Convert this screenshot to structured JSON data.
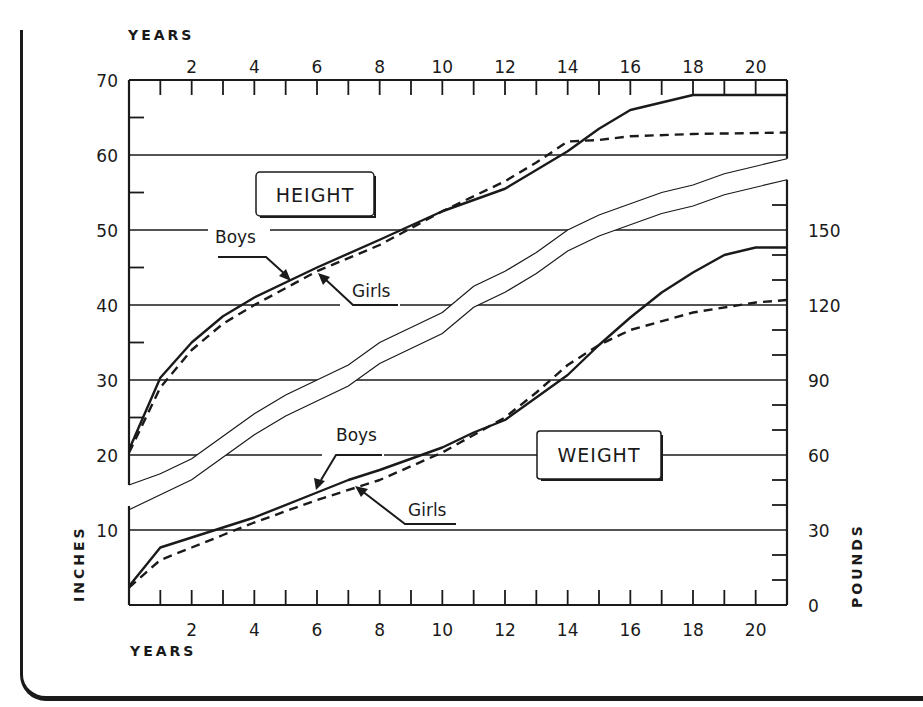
{
  "chart_data": {
    "type": "line",
    "title": "",
    "x_axis": {
      "label_top": "YEARS",
      "label_bottom": "YEARS",
      "range": [
        0,
        21
      ],
      "ticks": [
        2,
        4,
        6,
        8,
        10,
        12,
        14,
        16,
        18,
        20
      ],
      "minor_tick_step": 1
    },
    "y_axis_left": {
      "label": "INCHES",
      "range": [
        0,
        70
      ],
      "ticks": [
        10,
        20,
        30,
        40,
        50,
        60,
        70
      ],
      "minor_tick_step": 5
    },
    "y_axis_right": {
      "label": "POUNDS",
      "range": [
        0,
        175
      ],
      "ticks": [
        0,
        30,
        60,
        90,
        120,
        150
      ],
      "minor_tick_step": 10
    },
    "panels": [
      {
        "name": "HEIGHT",
        "axis": "left",
        "unit": "inches",
        "series": [
          {
            "name": "Boys",
            "style": "solid",
            "x": [
              0,
              1,
              2,
              3,
              4,
              6,
              8,
              10,
              12,
              13,
              14,
              15,
              16,
              18,
              21
            ],
            "values": [
              20.7,
              30.3,
              35,
              38.5,
              41,
              45,
              48.7,
              52.5,
              55.5,
              58,
              60.5,
              63.5,
              66,
              68,
              68
            ]
          },
          {
            "name": "Girls",
            "style": "dashed",
            "x": [
              0,
              1,
              2,
              3,
              4,
              6,
              8,
              10,
              12,
              13,
              14,
              15,
              16,
              18,
              21
            ],
            "values": [
              20.3,
              29,
              34,
              37.5,
              40,
              44.5,
              48,
              52.5,
              56.5,
              59,
              61.8,
              62,
              62.5,
              62.8,
              63
            ]
          }
        ]
      },
      {
        "name": "WEIGHT",
        "axis": "right",
        "unit": "pounds",
        "series": [
          {
            "name": "Boys",
            "style": "solid",
            "x": [
              0,
              1,
              2,
              3,
              4,
              6,
              7,
              8,
              10,
              11,
              12,
              13,
              14,
              15,
              16,
              17,
              18,
              19,
              20,
              21
            ],
            "values": [
              7.5,
              23,
              27,
              31,
              35,
              45,
              50,
              54,
              63,
              69,
              74,
              83,
              92,
              104,
              115,
              125,
              133,
              140,
              143,
              143
            ]
          },
          {
            "name": "Girls",
            "style": "dashed",
            "x": [
              0,
              1,
              2,
              3,
              4,
              6,
              8,
              10,
              11,
              12,
              13,
              14,
              15,
              16,
              18,
              20,
              21
            ],
            "values": [
              7,
              18,
              23,
              28,
              33,
              42,
              50,
              61,
              68,
              75,
              85,
              96,
              104,
              110,
              117,
              121,
              122
            ]
          }
        ]
      }
    ],
    "annotations": [
      "HEIGHT",
      "WEIGHT",
      "Boys",
      "Girls",
      "Boys",
      "Girls"
    ],
    "grid": true,
    "legend": "inline arrows"
  },
  "labels": {
    "years_top": "YEARS",
    "years_bottom": "YEARS",
    "inches": "INCHES",
    "pounds": "POUNDS",
    "height_box": "HEIGHT",
    "weight_box": "WEIGHT",
    "height_boys": "Boys",
    "height_girls": "Girls",
    "weight_boys": "Boys",
    "weight_girls": "Girls"
  },
  "ticks": {
    "x_top": [
      "2",
      "4",
      "6",
      "8",
      "10",
      "12",
      "14",
      "16",
      "18",
      "20"
    ],
    "x_bottom": [
      "2",
      "4",
      "6",
      "8",
      "10",
      "12",
      "14",
      "16",
      "18",
      "20"
    ],
    "left": [
      "70",
      "60",
      "50",
      "40",
      "30",
      "20",
      "10"
    ],
    "right": [
      "150",
      "120",
      "90",
      "60",
      "30",
      "0"
    ]
  }
}
